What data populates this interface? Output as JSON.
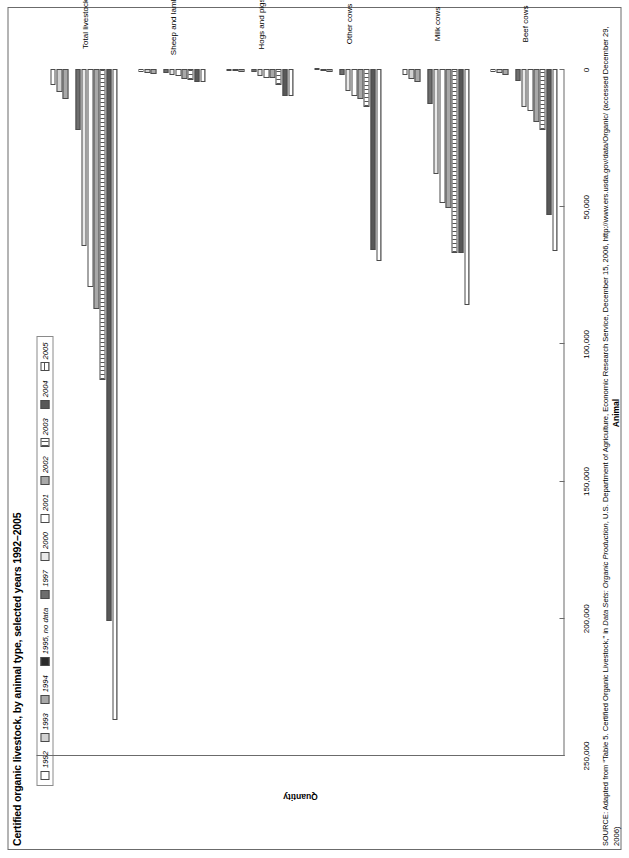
{
  "title": "Certified organic livestock, by animal type, selected years 1992–2005",
  "axis": {
    "x_title": "Animal",
    "y_title": "Quantity",
    "y_ticks": [
      "250,000",
      "200,000",
      "150,000",
      "100,000",
      "50,000",
      "0"
    ],
    "y_min": 0,
    "y_max": 250000
  },
  "legend": {
    "items": [
      {
        "label": "1992",
        "fill": "f-white"
      },
      {
        "label": "1993",
        "fill": "f-l2"
      },
      {
        "label": "1994",
        "fill": "f-mid"
      },
      {
        "label": "1995, no data",
        "fill": "f-black"
      },
      {
        "label": "1997",
        "fill": "f-dark"
      },
      {
        "label": "2000",
        "fill": "f-l1"
      },
      {
        "label": "2001",
        "fill": "f-white"
      },
      {
        "label": "2002",
        "fill": "f-mid"
      },
      {
        "label": "2003",
        "fill": "f-vthin2"
      },
      {
        "label": "2004",
        "fill": "f-dkgray"
      },
      {
        "label": "2005",
        "fill": "f-hthin"
      }
    ]
  },
  "source": {
    "prefix": "SOURCE",
    "text_before_italic": ": Adapted from “Table 5. Certified Organic Livestock,” in ",
    "italic": "Data Sets: Organic Production",
    "text_after_italic": ", U.S. Department of Agriculture, Economic Research Service, December 15, 2006, http://www.ers.usda.gov/data/Organic/ (accessed December 29, 2006)"
  },
  "chart_data": {
    "type": "bar",
    "title": "Certified organic livestock, by animal type, selected years 1992–2005",
    "xlabel": "Animal",
    "ylabel": "Quantity",
    "ylim": [
      0,
      250000
    ],
    "grid": false,
    "legend_position": "top-left",
    "categories": [
      "Beef cows",
      "Milk cows",
      "Other cows",
      "Hogs and pigs",
      "Sheep and lambs",
      "Total livestock"
    ],
    "series": [
      {
        "name": "1992",
        "fill": "f-white",
        "values": [
          1200,
          2265,
          450,
          670,
          1100,
          5700
        ]
      },
      {
        "name": "1993",
        "fill": "f-l2",
        "values": [
          1500,
          3700,
          700,
          900,
          1400,
          8200
        ]
      },
      {
        "name": "1994",
        "fill": "f-mid",
        "values": [
          2200,
          4600,
          1200,
          1200,
          1800,
          11000
        ]
      },
      {
        "name": "1995, no data",
        "fill": "f-black",
        "values": [
          0,
          0,
          0,
          0,
          0,
          0
        ]
      },
      {
        "name": "1997",
        "fill": "f-dark",
        "values": [
          4429,
          12897,
          2100,
          1200,
          1600,
          22222
        ]
      },
      {
        "name": "2000",
        "fill": "f-l1",
        "values": [
          13829,
          38196,
          8000,
          2400,
          2100,
          64500
        ]
      },
      {
        "name": "2001",
        "fill": "f-white",
        "values": [
          15197,
          48677,
          10000,
          3135,
          2582,
          79600
        ]
      },
      {
        "name": "2002",
        "fill": "f-mid",
        "values": [
          19144,
          50660,
          11000,
          3135,
          3500,
          87500
        ]
      },
      {
        "name": "2003",
        "fill": "f-vthin2",
        "values": [
          22155,
          67207,
          14000,
          6000,
          4000,
          113400
        ]
      },
      {
        "name": "2004",
        "fill": "f-dkgray",
        "values": [
          53276,
          67207,
          66000,
          10018,
          4567,
          201000
        ]
      },
      {
        "name": "2005",
        "fill": "f-hthin",
        "values": [
          66341,
          86032,
          70000,
          10018,
          4916,
          237400
        ]
      }
    ]
  }
}
